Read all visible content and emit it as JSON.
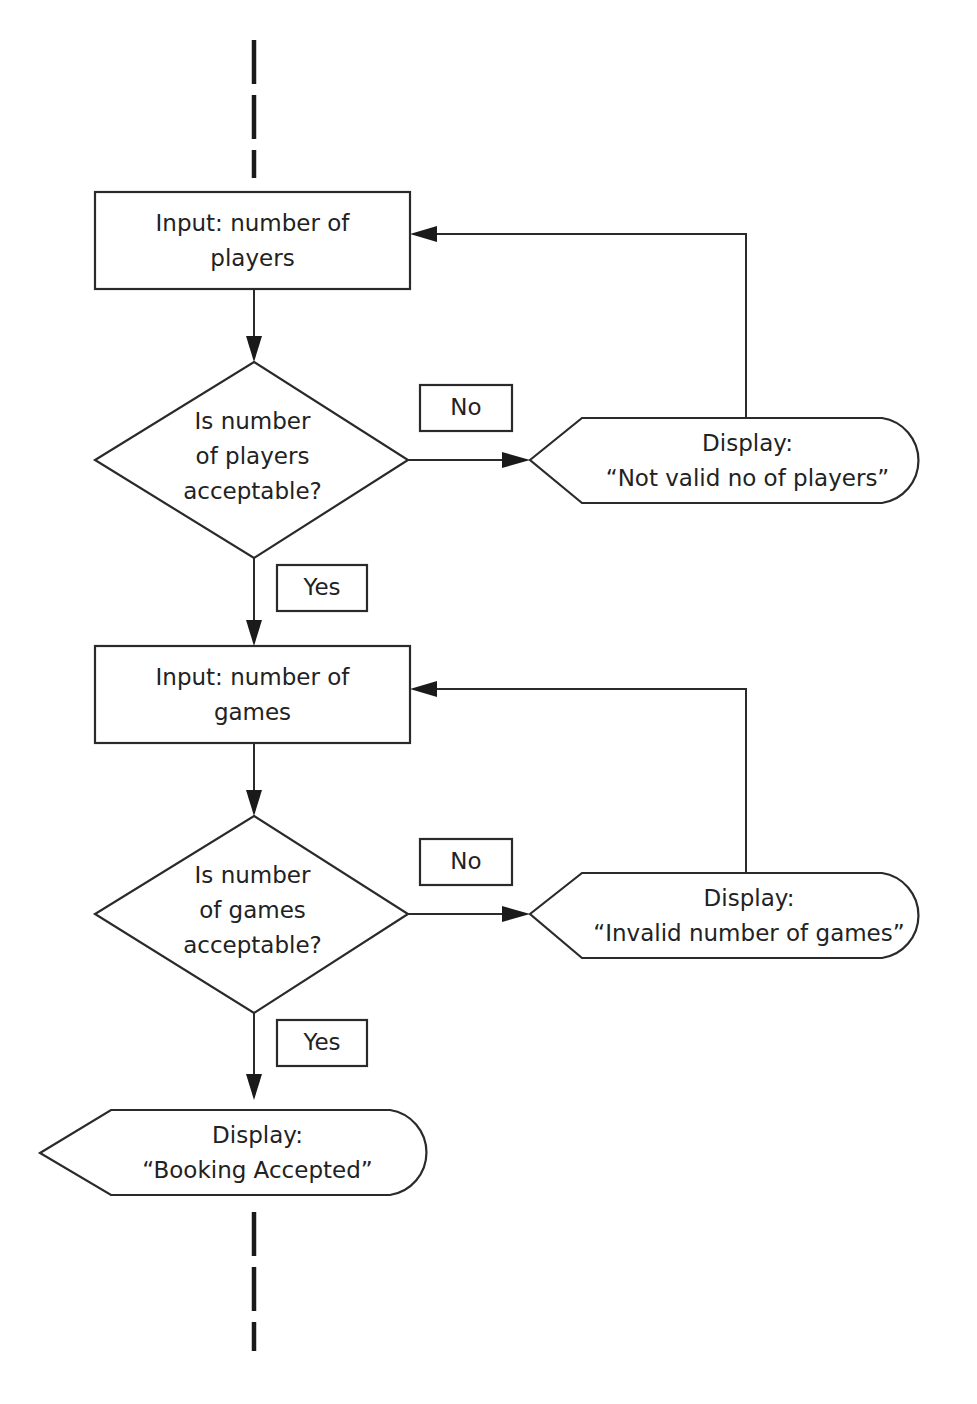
{
  "diagram": {
    "type": "flowchart",
    "colors": {
      "stroke": "#2a2a2a",
      "fill": "#ffffff",
      "text": "#222222"
    },
    "nodes": {
      "input_players": {
        "shape": "rectangle",
        "line1": "Input: number of",
        "line2": "players"
      },
      "decision_players": {
        "shape": "diamond",
        "line1": "Is number",
        "line2": "of players",
        "line3": "acceptable?"
      },
      "display_invalid_players": {
        "shape": "display",
        "line1": "Display:",
        "line2": "“Not valid no of players”"
      },
      "input_games": {
        "shape": "rectangle",
        "line1": "Input: number of",
        "line2": "games"
      },
      "decision_games": {
        "shape": "diamond",
        "line1": "Is number",
        "line2": "of games",
        "line3": "acceptable?"
      },
      "display_invalid_games": {
        "shape": "display",
        "line1": "Display:",
        "line2": "“Invalid number of games”"
      },
      "display_accepted": {
        "shape": "display",
        "line1": "Display:",
        "line2": "“Booking Accepted”"
      }
    },
    "edge_labels": {
      "players_no": "No",
      "players_yes": "Yes",
      "games_no": "No",
      "games_yes": "Yes"
    },
    "edges": [
      {
        "from": "input_players",
        "to": "decision_players"
      },
      {
        "from": "decision_players",
        "to": "display_invalid_players",
        "label": "No"
      },
      {
        "from": "display_invalid_players",
        "to": "input_players"
      },
      {
        "from": "decision_players",
        "to": "input_games",
        "label": "Yes"
      },
      {
        "from": "input_games",
        "to": "decision_games"
      },
      {
        "from": "decision_games",
        "to": "display_invalid_games",
        "label": "No"
      },
      {
        "from": "display_invalid_games",
        "to": "input_games"
      },
      {
        "from": "decision_games",
        "to": "display_accepted",
        "label": "Yes"
      }
    ]
  }
}
